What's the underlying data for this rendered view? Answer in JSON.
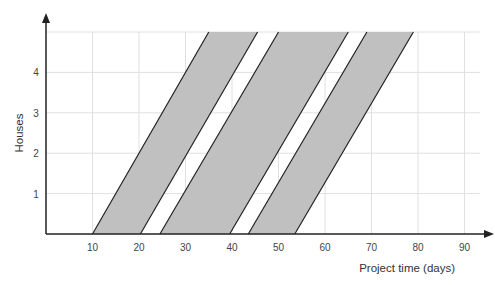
{
  "chart_data": {
    "type": "area",
    "title": "",
    "xlabel": "Project time (days)",
    "ylabel": "Houses",
    "xlim": [
      0,
      90
    ],
    "ylim": [
      0,
      5
    ],
    "x_ticks": [
      10,
      20,
      30,
      40,
      50,
      60,
      70,
      80,
      90
    ],
    "y_ticks": [
      1,
      2,
      3,
      4
    ],
    "grid": true,
    "legend": null,
    "fill_color": "#c0c0c0",
    "edge_color": "#222222",
    "grid_color": "#e0e0e0",
    "series": [
      {
        "name": "Band 1",
        "start_at_0": 10,
        "end_at_0": 20.3,
        "start_at_top": 35,
        "end_at_top": 45.5
      },
      {
        "name": "Band 2",
        "start_at_0": 24.5,
        "end_at_0": 39.5,
        "start_at_top": 50,
        "end_at_top": 65
      },
      {
        "name": "Band 3",
        "start_at_0": 43.5,
        "end_at_0": 53.5,
        "start_at_top": 69,
        "end_at_top": 79
      }
    ],
    "top_y_value": 5
  },
  "layout": {
    "origin_px": [
      46,
      234
    ],
    "px_per_x_unit": 4.65,
    "px_per_y_unit": 40.4,
    "plot_right_px": 480,
    "plot_top_px": 32
  }
}
